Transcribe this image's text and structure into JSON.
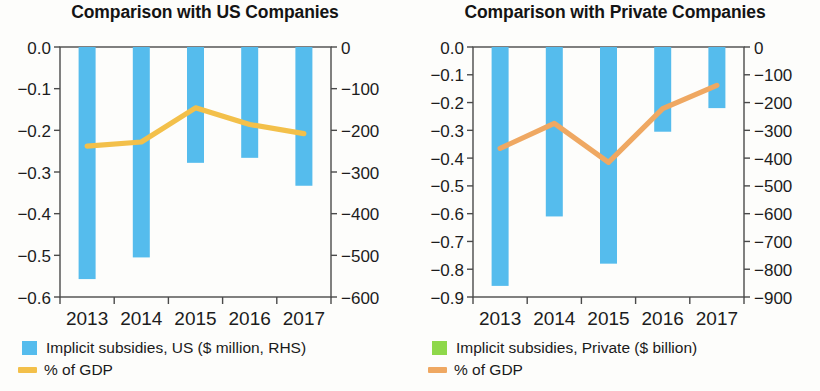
{
  "panels": [
    {
      "title": "Comparison with US Companies",
      "legend": [
        {
          "type": "box",
          "color": "#55bced",
          "label": "Implicit subsidies, US ($ million, RHS)"
        },
        {
          "type": "line",
          "color": "#f3c04a",
          "label": "% of GDP"
        }
      ]
    },
    {
      "title": "Comparison with Private Companies",
      "legend": [
        {
          "type": "box",
          "color": "#8ed84a",
          "label": "Implicit subsidies, Private ($ billion)"
        },
        {
          "type": "line",
          "color": "#efa862",
          "label": "% of GDP"
        }
      ]
    }
  ],
  "chart_data": [
    {
      "type": "bar",
      "title": "Comparison with US Companies",
      "xlabel": "",
      "ylabel": "",
      "categories": [
        "2013",
        "2014",
        "2015",
        "2016",
        "2017"
      ],
      "xticklabels": [
        "2013",
        "2014",
        "2015",
        "2016",
        "2017"
      ],
      "yticklabels_left": [
        "0.0",
        "-0.1",
        "-0.2",
        "-0.3",
        "-0.4",
        "-0.5",
        "-0.6"
      ],
      "yticklabels_right": [
        "0",
        "-100",
        "-200",
        "-300",
        "-400",
        "-500",
        "-600"
      ],
      "ylim_left": [
        -0.6,
        0.0
      ],
      "ylim_right": [
        -600,
        0
      ],
      "grid": false,
      "legend_position": "below",
      "series": [
        {
          "name": "Implicit subsidies, US ($ million, RHS)",
          "kind": "bar",
          "axis": "right",
          "color": "#55bced",
          "unit": "$ million",
          "values": [
            -557,
            -505,
            -278,
            -266,
            -333
          ]
        },
        {
          "name": "% of GDP",
          "kind": "line",
          "axis": "left",
          "color": "#f3c04a",
          "unit": "percent of GDP",
          "values": [
            -0.238,
            -0.228,
            -0.146,
            -0.186,
            -0.208
          ]
        }
      ]
    },
    {
      "type": "bar",
      "title": "Comparison with Private Companies",
      "xlabel": "",
      "ylabel": "",
      "categories": [
        "2013",
        "2014",
        "2015",
        "2016",
        "2017"
      ],
      "xticklabels": [
        "2013",
        "2014",
        "2015",
        "2016",
        "2017"
      ],
      "yticklabels_left": [
        "0.0",
        "-0.1",
        "-0.2",
        "-0.3",
        "-0.4",
        "-0.5",
        "-0.6",
        "-0.7",
        "-0.8",
        "-0.9"
      ],
      "yticklabels_right": [
        "0",
        "-100",
        "-200",
        "-300",
        "-400",
        "-500",
        "-600",
        "-700",
        "-800",
        "-900"
      ],
      "ylim_left": [
        -0.9,
        0.0
      ],
      "ylim_right": [
        -900,
        0
      ],
      "grid": false,
      "legend_position": "below",
      "series": [
        {
          "name": "Implicit subsidies, Private ($ billion)",
          "kind": "bar",
          "axis": "right",
          "color": "#55bced",
          "unit": "$ billion",
          "values": [
            -860,
            -610,
            -780,
            -305,
            -220
          ]
        },
        {
          "name": "% of GDP",
          "kind": "line",
          "axis": "left",
          "color": "#efa862",
          "unit": "percent of GDP",
          "values": [
            -0.365,
            -0.275,
            -0.415,
            -0.222,
            -0.138
          ]
        }
      ]
    }
  ]
}
